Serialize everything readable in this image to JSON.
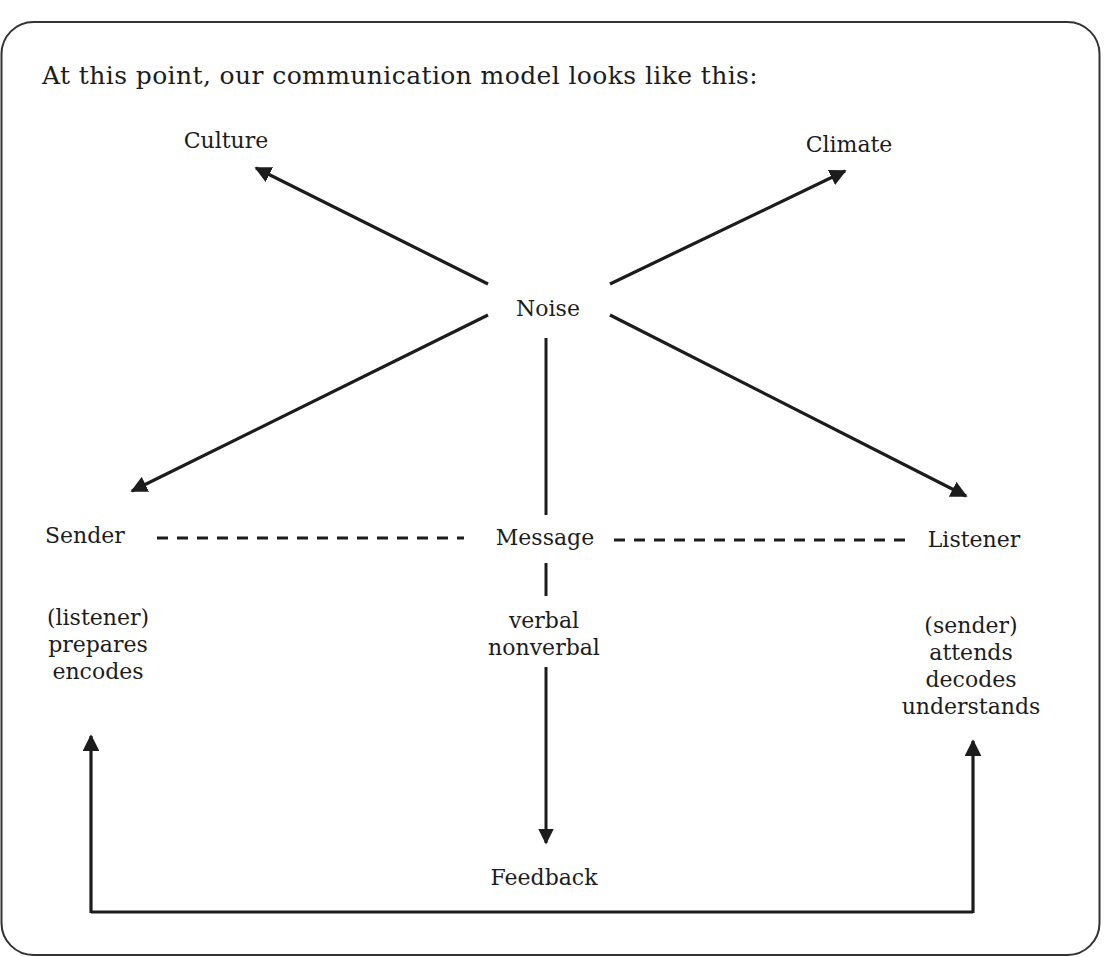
{
  "title": "At this point, our communication model looks like this:",
  "nodes": {
    "noise": "Noise",
    "culture": "Culture",
    "climate": "Climate",
    "sender": "Sender",
    "message": "Message",
    "listener": "Listener",
    "feedback": "Feedback"
  },
  "details": {
    "sender": [
      "(listener)",
      "prepares",
      "encodes"
    ],
    "message": [
      "verbal",
      "nonverbal"
    ],
    "listener": [
      "(sender)",
      "attends",
      "decodes",
      "understands"
    ]
  },
  "edges": [
    {
      "from": "Noise",
      "to": "Culture",
      "style": "arrow"
    },
    {
      "from": "Noise",
      "to": "Climate",
      "style": "arrow"
    },
    {
      "from": "Noise",
      "to": "Sender",
      "style": "arrow"
    },
    {
      "from": "Noise",
      "to": "Listener",
      "style": "arrow"
    },
    {
      "from": "Noise",
      "to": "Message",
      "style": "line"
    },
    {
      "from": "Sender",
      "to": "Message",
      "style": "dashed"
    },
    {
      "from": "Message",
      "to": "Listener",
      "style": "dashed"
    },
    {
      "from": "Message",
      "to": "Feedback",
      "style": "arrow"
    },
    {
      "from": "Feedback",
      "to": "Sender",
      "style": "arrow"
    },
    {
      "from": "Feedback",
      "to": "Listener",
      "style": "arrow"
    }
  ],
  "colors": {
    "ink": "#1c1c1c",
    "frame": "#333333",
    "background": "#ffffff"
  }
}
